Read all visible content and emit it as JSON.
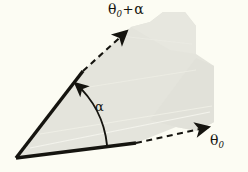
{
  "figure": {
    "name": "angle-rotation-diagram",
    "background_color": "#fcfcf3",
    "ink_color": "#15140f",
    "shade_color": "#e4e4dc",
    "width": 248,
    "height": 172
  },
  "labels": {
    "upper_ray": {
      "symbol": "θ",
      "subscript": "0",
      "operator": "+",
      "second_symbol": "α",
      "full_text": "θ₀+α"
    },
    "lower_ray": {
      "symbol": "θ",
      "subscript": "0",
      "full_text": "θ₀"
    },
    "arc": {
      "symbol": "α",
      "full_text": "α"
    }
  },
  "geometry": {
    "vertex": {
      "x": 16,
      "y": 158
    },
    "lower_ray": {
      "solid_end": {
        "x": 136,
        "y": 143
      },
      "dashed_end": {
        "x": 214,
        "y": 126
      },
      "arrowhead": "arrow-right"
    },
    "upper_ray": {
      "solid_end": {
        "x": 83,
        "y": 71
      },
      "dashed_end": {
        "x": 131,
        "y": 27
      },
      "arrowhead": "arrow-up-right"
    },
    "arc": {
      "center": {
        "x": 16,
        "y": 158
      },
      "radius": 98,
      "start": {
        "x": 105,
        "y": 146
      },
      "end": {
        "x": 74,
        "y": 82
      },
      "arrowhead": "arrow-up-left"
    },
    "shaded_region": {
      "type": "irregular-polygon",
      "points": "16,158 83,71 131,27 150,22 163,12 185,12 196,26 196,54 214,66 214,122 198,131 176,127 136,143"
    }
  },
  "icons": {
    "arrow_upper": "arrow-up-right-icon",
    "arrow_lower": "arrow-right-icon",
    "arrow_arc": "arc-arrow-icon"
  }
}
